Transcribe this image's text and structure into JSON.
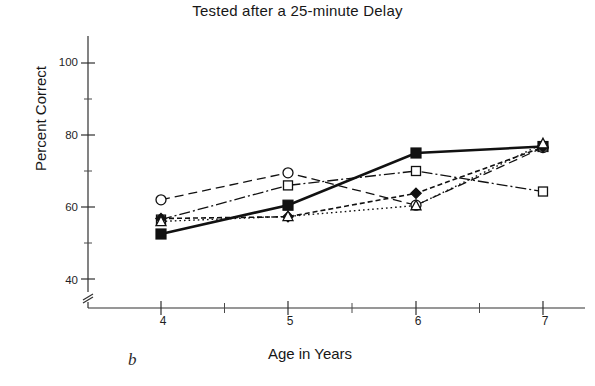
{
  "chart_data": {
    "type": "line",
    "title": "Tested after a 25-minute Delay",
    "xlabel": "Age in Years",
    "ylabel": "Percent Correct",
    "panel_label": "b",
    "x": [
      4,
      5,
      6,
      7
    ],
    "xtick_labels": [
      "4",
      "5",
      "6",
      "7"
    ],
    "ytick_labels": [
      "40",
      "60",
      "80",
      "100"
    ],
    "yticks": [
      40,
      60,
      80,
      100
    ],
    "yminor_ticks": [
      50,
      70,
      90
    ],
    "xminor_ticks": [
      4.5,
      5.5,
      6.5
    ],
    "xlim": [
      3.75,
      7.2
    ],
    "ylim": [
      36,
      104
    ],
    "axis_break": true,
    "grid": false,
    "legend": "none",
    "series": [
      {
        "name": "series-filled-square",
        "marker": "filled-square",
        "linestyle": "solid",
        "values": [
          52.5,
          60.5,
          75.0,
          76.8
        ]
      },
      {
        "name": "series-open-circle",
        "marker": "open-circle",
        "linestyle": "dashed",
        "values": [
          62.0,
          69.5,
          60.5,
          76.5
        ]
      },
      {
        "name": "series-open-square",
        "marker": "open-square",
        "linestyle": "dash-dot",
        "values": [
          56.5,
          66.0,
          70.0,
          64.3
        ]
      },
      {
        "name": "series-filled-diamond",
        "marker": "filled-diamond",
        "linestyle": "short-dash",
        "values": [
          56.8,
          57.3,
          63.8,
          76.6
        ]
      },
      {
        "name": "series-open-triangle",
        "marker": "open-triangle",
        "linestyle": "dotted",
        "values": [
          56.0,
          57.4,
          60.4,
          77.6
        ]
      }
    ],
    "colors": {
      "ink": "#111111",
      "axis": "#303030",
      "background": "#ffffff"
    }
  }
}
